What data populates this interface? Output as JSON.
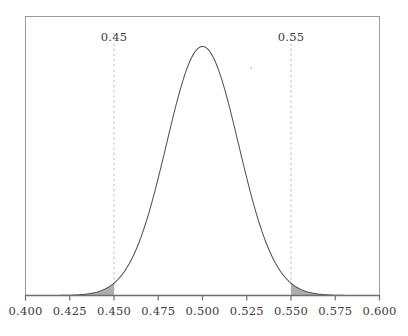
{
  "chart_data": {
    "type": "line",
    "title": "",
    "subtitle": "",
    "xlabel": "",
    "ylabel": "",
    "xlim": [
      0.4,
      0.6
    ],
    "ylim": [
      0,
      20.0
    ],
    "grid": false,
    "legend": null,
    "distribution": {
      "kind": "normal",
      "mean": 0.5,
      "sd": 0.0204,
      "peak_x": 0.5,
      "peak_density": 19.55
    },
    "x_ticks": [
      0.4,
      0.425,
      0.45,
      0.475,
      0.5,
      0.525,
      0.55,
      0.575,
      0.6
    ],
    "x_tick_labels": [
      "0.400",
      "0.425",
      "0.450",
      "0.475",
      "0.500",
      "0.525",
      "0.550",
      "0.575",
      "0.600"
    ],
    "y_ticks": [],
    "y_tick_labels": [],
    "annotations": [
      {
        "id": "left-cutoff",
        "label": "0.45",
        "x": 0.45,
        "style": "dashed-vertical-line"
      },
      {
        "id": "right-cutoff",
        "label": "0.55",
        "x": 0.55,
        "style": "dashed-vertical-line"
      }
    ],
    "shaded_regions": [
      {
        "id": "left-tail",
        "from": 0.4,
        "to": 0.45,
        "fill": "#a9a9a9"
      },
      {
        "id": "right-tail",
        "from": 0.55,
        "to": 0.6,
        "fill": "#a9a9a9"
      }
    ],
    "series": [
      {
        "name": "normal-density",
        "x": [
          0.4,
          0.405,
          0.41,
          0.415,
          0.42,
          0.425,
          0.43,
          0.435,
          0.44,
          0.445,
          0.45,
          0.455,
          0.46,
          0.465,
          0.47,
          0.475,
          0.48,
          0.485,
          0.49,
          0.495,
          0.5,
          0.505,
          0.51,
          0.515,
          0.52,
          0.525,
          0.53,
          0.535,
          0.54,
          0.545,
          0.55,
          0.555,
          0.56,
          0.565,
          0.57,
          0.575,
          0.58,
          0.585,
          0.59,
          0.595,
          0.6
        ],
        "values": [
          0.01,
          0.03,
          0.08,
          0.22,
          0.56,
          1.32,
          2.88,
          5.81,
          10.85,
          18.71,
          29.81,
          43.92,
          59.79,
          75.16,
          87.21,
          93.36,
          97.24,
          99.31,
          100.0,
          99.78,
          100.0,
          99.78,
          100.0,
          99.31,
          97.24,
          93.36,
          87.21,
          75.16,
          59.79,
          43.92,
          29.81,
          18.71,
          10.85,
          5.81,
          2.88,
          1.32,
          0.56,
          0.22,
          0.08,
          0.03,
          0.01
        ]
      }
    ]
  },
  "axis": {
    "tick_labels": [
      "0.400",
      "0.425",
      "0.450",
      "0.475",
      "0.500",
      "0.525",
      "0.550",
      "0.575",
      "0.600"
    ]
  },
  "cutoffs": [
    {
      "label": "0.45"
    },
    {
      "label": "0.55"
    }
  ],
  "colors": {
    "curve": "#555555",
    "frame": "#9a9a9a",
    "axis": "#6e6e6e",
    "shade": "#a9a9a9",
    "dashed": "#bdbdbd",
    "text": "#3b3b3b",
    "background": "#ffffff"
  }
}
